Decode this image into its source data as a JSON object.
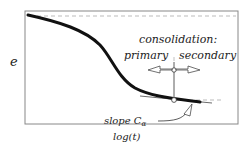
{
  "diagram": {
    "y_axis_label": "e",
    "x_axis_label": "log(t)",
    "annotation_title": "consolidation:",
    "phase_primary": "primary",
    "phase_secondary": "secondary",
    "slope_label": "slope C",
    "slope_subscript": "α",
    "colors": {
      "frame": "#888888",
      "curve": "#111111",
      "dashed": "#aaaaaa",
      "text": "#222222"
    }
  }
}
